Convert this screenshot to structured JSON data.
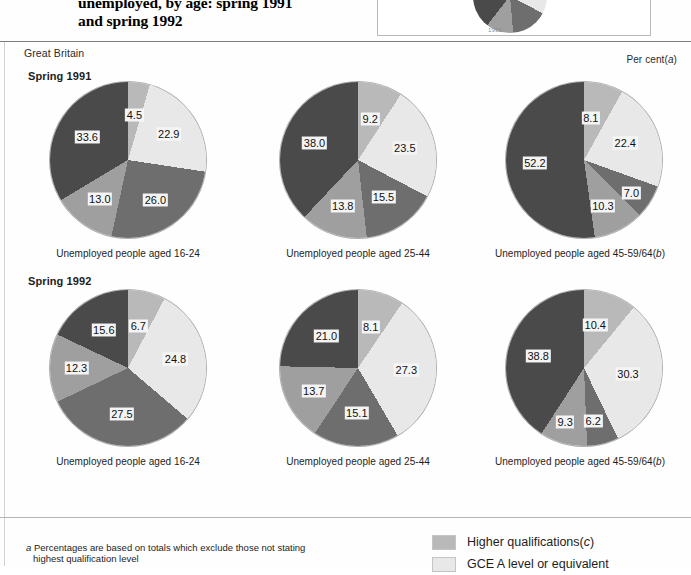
{
  "title": {
    "line1": "unemployed, by age: spring 1991",
    "line2": "and spring 1992"
  },
  "inset": {
    "year_label": "1992"
  },
  "header": {
    "geography": "Great Britain",
    "units_prefix": "Per cent(",
    "units_note": "a",
    "units_suffix": ")"
  },
  "sections": [
    {
      "season_label": "Spring 1991"
    },
    {
      "season_label": "Spring 1992"
    }
  ],
  "captions": {
    "age_16_24": "Unemployed people aged 16-24",
    "age_25_44": "Unemployed people aged 25-44",
    "age_45_64_prefix": "Unemployed people aged 45-59/64(",
    "age_45_64_note": "b",
    "age_45_64_suffix": ")"
  },
  "colors": {
    "higher_qualifications": "#b9b9b9",
    "gce_a_level": "#e8e8e8",
    "mid_dark": "#6e6e6e",
    "light_mid": "#9f9f9f",
    "darkest": "#4a4a4a",
    "label_background": "#f4f4f4",
    "rule": "#7d7d7d"
  },
  "footnotes": {
    "a_marker": "a",
    "a_text": "Percentages are based on totals which exclude those not stating",
    "a_text_cont": "highest qualification level"
  },
  "legend": {
    "items": [
      {
        "label_prefix": "Higher qualifications(",
        "note": "c",
        "label_suffix": ")",
        "color": "#b9b9b9"
      },
      {
        "label_prefix": "GCE A level or equivalent",
        "note": "",
        "label_suffix": "",
        "color": "#e8e8e8"
      }
    ]
  },
  "chart_data": [
    {
      "type": "pie",
      "title": "Unemployed people aged 16-24",
      "group": "Spring 1991",
      "categories": [
        "Higher qualifications",
        "GCE A level or equivalent",
        "Other qualifications",
        "Intermediate qualifications",
        "No qualifications"
      ],
      "values": [
        4.5,
        22.9,
        26.0,
        13.0,
        33.6
      ],
      "colors": [
        "#b9b9b9",
        "#e8e8e8",
        "#6e6e6e",
        "#9f9f9f",
        "#4a4a4a"
      ],
      "start_angle": 0,
      "ylabel": "Per cent"
    },
    {
      "type": "pie",
      "title": "Unemployed people aged 25-44",
      "group": "Spring 1991",
      "categories": [
        "Higher qualifications",
        "GCE A level or equivalent",
        "Other qualifications",
        "Intermediate qualifications",
        "No qualifications"
      ],
      "values": [
        9.2,
        23.5,
        15.5,
        13.8,
        38.0
      ],
      "colors": [
        "#b9b9b9",
        "#e8e8e8",
        "#6e6e6e",
        "#9f9f9f",
        "#4a4a4a"
      ],
      "start_angle": 0,
      "ylabel": "Per cent"
    },
    {
      "type": "pie",
      "title": "Unemployed people aged 45-59/64",
      "group": "Spring 1991",
      "categories": [
        "Higher qualifications",
        "GCE A level or equivalent",
        "Other qualifications",
        "Intermediate qualifications",
        "No qualifications"
      ],
      "values": [
        8.1,
        22.4,
        7.0,
        10.3,
        52.2
      ],
      "colors": [
        "#b9b9b9",
        "#e8e8e8",
        "#6e6e6e",
        "#9f9f9f",
        "#4a4a4a"
      ],
      "start_angle": 0,
      "ylabel": "Per cent"
    },
    {
      "type": "pie",
      "title": "Unemployed people aged 16-24",
      "group": "Spring 1992",
      "categories": [
        "Higher qualifications",
        "GCE A level or equivalent",
        "Other qualifications",
        "Intermediate qualifications",
        "No qualifications"
      ],
      "values": [
        6.7,
        24.8,
        27.5,
        12.3,
        15.6
      ],
      "colors": [
        "#b9b9b9",
        "#e8e8e8",
        "#6e6e6e",
        "#9f9f9f",
        "#4a4a4a"
      ],
      "start_angle": 0,
      "ylabel": "Per cent"
    },
    {
      "type": "pie",
      "title": "Unemployed people aged 25-44",
      "group": "Spring 1992",
      "categories": [
        "Higher qualifications",
        "GCE A level or equivalent",
        "Other qualifications",
        "Intermediate qualifications",
        "No qualifications"
      ],
      "values": [
        8.1,
        27.3,
        15.1,
        13.7,
        21.0
      ],
      "colors": [
        "#b9b9b9",
        "#e8e8e8",
        "#6e6e6e",
        "#9f9f9f",
        "#4a4a4a"
      ],
      "start_angle": 0,
      "ylabel": "Per cent"
    },
    {
      "type": "pie",
      "title": "Unemployed people aged 45-59/64",
      "group": "Spring 1992",
      "categories": [
        "Higher qualifications",
        "GCE A level or equivalent",
        "Other qualifications",
        "Intermediate qualifications",
        "No qualifications"
      ],
      "values": [
        10.4,
        30.3,
        6.2,
        9.3,
        38.8
      ],
      "colors": [
        "#b9b9b9",
        "#e8e8e8",
        "#6e6e6e",
        "#9f9f9f",
        "#4a4a4a"
      ],
      "start_angle": 0,
      "ylabel": "Per cent"
    }
  ]
}
